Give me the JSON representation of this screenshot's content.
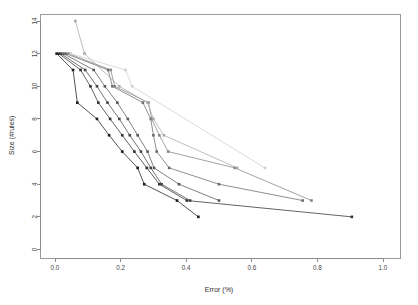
{
  "chart_data": {
    "type": "line",
    "title": "",
    "subtitle": "",
    "xlabel": "Error (%)",
    "ylabel": "Size (#rules)",
    "xlim": [
      0.0,
      1.0
    ],
    "ylim": [
      0,
      14
    ],
    "xticks": [
      0.0,
      0.2,
      0.4,
      0.6,
      0.8,
      1.0
    ],
    "xtick_labels": [
      "0.0",
      "0.2",
      "0.4",
      "0.6",
      "0.8",
      "1.0"
    ],
    "yticks": [
      0,
      2,
      4,
      6,
      8,
      10,
      12,
      14
    ],
    "ytick_labels": [
      "0",
      "2",
      "4",
      "6",
      "8",
      "10",
      "12",
      "14"
    ],
    "grid": false,
    "legend": "none",
    "marker": "filled-square",
    "marker_size": 2,
    "series": [
      {
        "name": "series-1",
        "color": "#1a1a1a",
        "points": [
          {
            "x": 0.005,
            "y": 12
          },
          {
            "x": 0.055,
            "y": 11
          },
          {
            "x": 0.068,
            "y": 9
          },
          {
            "x": 0.128,
            "y": 8
          },
          {
            "x": 0.165,
            "y": 7
          },
          {
            "x": 0.205,
            "y": 6
          },
          {
            "x": 0.252,
            "y": 5
          },
          {
            "x": 0.272,
            "y": 4
          },
          {
            "x": 0.372,
            "y": 3
          },
          {
            "x": 0.437,
            "y": 2
          }
        ]
      },
      {
        "name": "series-2",
        "color": "#2f2f2f",
        "points": [
          {
            "x": 0.012,
            "y": 12
          },
          {
            "x": 0.078,
            "y": 11
          },
          {
            "x": 0.108,
            "y": 10
          },
          {
            "x": 0.132,
            "y": 9
          },
          {
            "x": 0.168,
            "y": 8
          },
          {
            "x": 0.205,
            "y": 7
          },
          {
            "x": 0.242,
            "y": 6
          },
          {
            "x": 0.28,
            "y": 5
          },
          {
            "x": 0.318,
            "y": 4
          },
          {
            "x": 0.402,
            "y": 3
          },
          {
            "x": 0.905,
            "y": 2
          }
        ]
      },
      {
        "name": "series-3",
        "color": "#444444",
        "points": [
          {
            "x": 0.018,
            "y": 12
          },
          {
            "x": 0.092,
            "y": 11
          },
          {
            "x": 0.128,
            "y": 10
          },
          {
            "x": 0.16,
            "y": 9
          },
          {
            "x": 0.196,
            "y": 8
          },
          {
            "x": 0.228,
            "y": 7
          },
          {
            "x": 0.262,
            "y": 6
          },
          {
            "x": 0.292,
            "y": 5
          },
          {
            "x": 0.325,
            "y": 4
          },
          {
            "x": 0.412,
            "y": 3
          }
        ]
      },
      {
        "name": "series-4",
        "color": "#575757",
        "points": [
          {
            "x": 0.026,
            "y": 12
          },
          {
            "x": 0.118,
            "y": 11
          },
          {
            "x": 0.152,
            "y": 10
          },
          {
            "x": 0.19,
            "y": 9
          },
          {
            "x": 0.222,
            "y": 8
          },
          {
            "x": 0.252,
            "y": 7
          },
          {
            "x": 0.282,
            "y": 6
          },
          {
            "x": 0.302,
            "y": 5
          },
          {
            "x": 0.378,
            "y": 4
          },
          {
            "x": 0.5,
            "y": 3
          }
        ]
      },
      {
        "name": "series-5",
        "color": "#6b6b6b",
        "points": [
          {
            "x": 0.034,
            "y": 12
          },
          {
            "x": 0.162,
            "y": 11
          },
          {
            "x": 0.175,
            "y": 10
          },
          {
            "x": 0.268,
            "y": 9
          },
          {
            "x": 0.292,
            "y": 8
          },
          {
            "x": 0.3,
            "y": 7
          },
          {
            "x": 0.31,
            "y": 6
          },
          {
            "x": 0.348,
            "y": 5
          },
          {
            "x": 0.5,
            "y": 4
          },
          {
            "x": 0.755,
            "y": 3
          }
        ]
      },
      {
        "name": "series-6",
        "color": "#848484",
        "points": [
          {
            "x": 0.042,
            "y": 12
          },
          {
            "x": 0.17,
            "y": 11
          },
          {
            "x": 0.182,
            "y": 10
          },
          {
            "x": 0.285,
            "y": 9
          },
          {
            "x": 0.295,
            "y": 8
          },
          {
            "x": 0.318,
            "y": 7
          },
          {
            "x": 0.345,
            "y": 6
          },
          {
            "x": 0.548,
            "y": 5
          },
          {
            "x": 0.782,
            "y": 3
          }
        ]
      },
      {
        "name": "series-7",
        "color": "#a8a8a8",
        "points": [
          {
            "x": 0.062,
            "y": 14
          },
          {
            "x": 0.09,
            "y": 12
          },
          {
            "x": 0.196,
            "y": 10
          },
          {
            "x": 0.282,
            "y": 9
          },
          {
            "x": 0.3,
            "y": 8
          },
          {
            "x": 0.332,
            "y": 7
          },
          {
            "x": 0.555,
            "y": 5
          }
        ]
      },
      {
        "name": "series-8",
        "color": "#cfcfcf",
        "points": [
          {
            "x": 0.048,
            "y": 12
          },
          {
            "x": 0.215,
            "y": 11
          },
          {
            "x": 0.235,
            "y": 10
          },
          {
            "x": 0.64,
            "y": 5
          }
        ]
      }
    ]
  }
}
